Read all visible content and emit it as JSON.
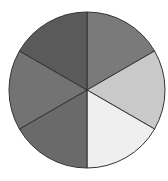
{
  "chart_data": {
    "type": "pie",
    "title": "",
    "categories": [
      "Slice 1",
      "Slice 2",
      "Slice 3",
      "Slice 4",
      "Slice 5",
      "Slice 6"
    ],
    "values": [
      16.67,
      16.67,
      16.67,
      16.67,
      16.67,
      16.67
    ],
    "colors": [
      "#7a7a7a",
      "#c9c9c9",
      "#efefef",
      "#6a6a6a",
      "#737373",
      "#5a5a5a"
    ],
    "start_angle_deg": -90,
    "direction": "clockwise",
    "legend": "none",
    "labels_shown": false
  },
  "layout": {
    "cx": 87,
    "cy": 90,
    "r": 78,
    "stroke": "#333333"
  }
}
